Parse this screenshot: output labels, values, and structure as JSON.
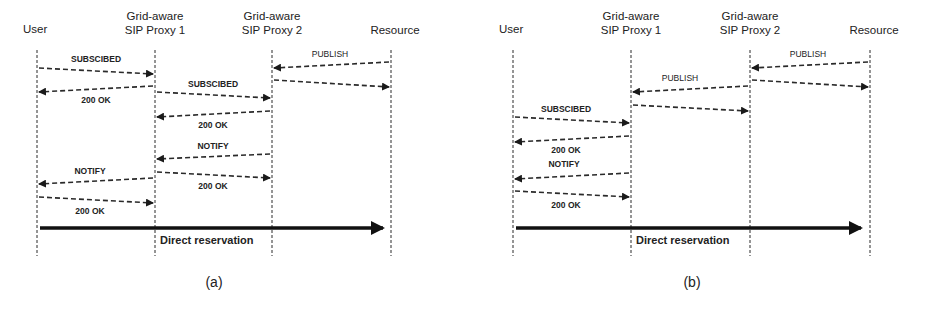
{
  "colors": {
    "line": "#2a2a2a",
    "background": "#ffffff"
  },
  "panels": [
    {
      "caption": "(a)",
      "lifelines": [
        {
          "name": "User",
          "label_lines": [
            "User"
          ],
          "x": 37
        },
        {
          "name": "Grid-aware SIP Proxy 1",
          "label_lines": [
            "Grid-aware",
            "SIP Proxy 1"
          ],
          "x": 155
        },
        {
          "name": "Grid-aware SIP Proxy 2",
          "label_lines": [
            "Grid-aware",
            "SIP Proxy 2"
          ],
          "x": 272
        },
        {
          "name": "Resource",
          "label_lines": [
            "Resource"
          ],
          "x": 391
        }
      ],
      "messages": [
        {
          "label": "PUBLISH",
          "from": 3,
          "to": 2,
          "y1": 62,
          "y2": 68,
          "label_x": 330,
          "label_y": 57,
          "bold": false
        },
        {
          "label": "",
          "from": 2,
          "to": 3,
          "y1": 80,
          "y2": 87,
          "bold": false
        },
        {
          "label": "SUBSCIBED",
          "from": 0,
          "to": 1,
          "y1": 68,
          "y2": 74,
          "label_x": 96,
          "label_y": 62,
          "bold": true
        },
        {
          "label": "200 OK",
          "from": 1,
          "to": 0,
          "y1": 86,
          "y2": 92,
          "label_x": 96,
          "label_y": 103,
          "bold": true
        },
        {
          "label": "SUBSCIBED",
          "from": 1,
          "to": 2,
          "y1": 92,
          "y2": 98,
          "label_x": 213,
          "label_y": 87,
          "bold": true
        },
        {
          "label": "200 OK",
          "from": 2,
          "to": 1,
          "y1": 111,
          "y2": 117,
          "label_x": 213,
          "label_y": 128,
          "bold": true
        },
        {
          "label": "NOTIFY",
          "from": 2,
          "to": 1,
          "y1": 154,
          "y2": 159,
          "label_x": 213,
          "label_y": 149,
          "bold": true
        },
        {
          "label": "200 OK",
          "from": 1,
          "to": 2,
          "y1": 172,
          "y2": 178,
          "label_x": 213,
          "label_y": 189,
          "bold": true
        },
        {
          "label": "NOTIFY",
          "from": 1,
          "to": 0,
          "y1": 178,
          "y2": 184,
          "label_x": 90,
          "label_y": 174,
          "bold": true
        },
        {
          "label": "200 OK",
          "from": 0,
          "to": 1,
          "y1": 197,
          "y2": 203,
          "label_x": 90,
          "label_y": 214,
          "bold": true
        }
      ],
      "reservation": {
        "label": "Direct reservation",
        "x1": 40,
        "x2": 383,
        "y": 228,
        "label_x": 160,
        "label_y": 244
      }
    },
    {
      "caption": "(b)",
      "lifelines": [
        {
          "name": "User",
          "label_lines": [
            "User"
          ],
          "x": 513
        },
        {
          "name": "Grid-aware SIP Proxy 1",
          "label_lines": [
            "Grid-aware",
            "SIP Proxy 1"
          ],
          "x": 631
        },
        {
          "name": "Grid-aware SIP Proxy 2",
          "label_lines": [
            "Grid-aware",
            "SIP Proxy 2"
          ],
          "x": 750
        },
        {
          "name": "Resource",
          "label_lines": [
            "Resource"
          ],
          "x": 870
        }
      ],
      "messages": [
        {
          "label": "PUBLISH",
          "from": 3,
          "to": 2,
          "y1": 62,
          "y2": 68,
          "label_x": 808,
          "label_y": 57,
          "bold": false
        },
        {
          "label": "",
          "from": 2,
          "to": 3,
          "y1": 80,
          "y2": 87,
          "bold": false
        },
        {
          "label": "PUBLISH",
          "from": 2,
          "to": 1,
          "y1": 86,
          "y2": 92,
          "label_x": 680,
          "label_y": 81,
          "bold": false
        },
        {
          "label": "",
          "from": 1,
          "to": 2,
          "y1": 105,
          "y2": 111,
          "bold": false
        },
        {
          "label": "SUBSCIBED",
          "from": 0,
          "to": 1,
          "y1": 117,
          "y2": 123,
          "label_x": 566,
          "label_y": 112,
          "bold": true
        },
        {
          "label": "200 OK",
          "from": 1,
          "to": 0,
          "y1": 136,
          "y2": 142,
          "label_x": 566,
          "label_y": 153,
          "bold": true
        },
        {
          "label": "NOTIFY",
          "from": 1,
          "to": 0,
          "y1": 173,
          "y2": 179,
          "label_x": 564,
          "label_y": 167,
          "bold": true
        },
        {
          "label": "200 OK",
          "from": 0,
          "to": 1,
          "y1": 191,
          "y2": 197,
          "label_x": 566,
          "label_y": 208,
          "bold": true
        }
      ],
      "reservation": {
        "label": "Direct reservation",
        "x1": 516,
        "x2": 861,
        "y": 228,
        "label_x": 636,
        "label_y": 244
      }
    }
  ],
  "layout": {
    "lifeline_top": 50,
    "lifeline_bottom": 256,
    "caption_y": 287,
    "caption_a_x": 214,
    "caption_b_x": 692
  }
}
